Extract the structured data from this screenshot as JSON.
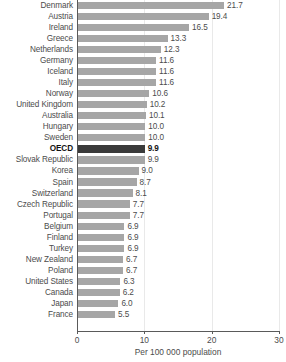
{
  "chart_data": {
    "type": "bar",
    "orientation": "horizontal",
    "title": "",
    "xlabel": "Per 100 000 population",
    "ylabel": "",
    "xlim": [
      0,
      30
    ],
    "xticks": [
      0,
      10,
      20,
      30
    ],
    "grid": true,
    "legend": false,
    "highlight_category": "OECD",
    "categories": [
      "Denmark",
      "Austria",
      "Ireland",
      "Greece",
      "Netherlands",
      "Germany",
      "Iceland",
      "Italy",
      "Norway",
      "United Kingdom",
      "Australia",
      "Hungary",
      "Sweden",
      "OECD",
      "Slovak Republic",
      "Korea",
      "Spain",
      "Switzerland",
      "Czech Republic",
      "Portugal",
      "Belgium",
      "Finland",
      "Turkey",
      "New Zealand",
      "Poland",
      "United States",
      "Canada",
      "Japan",
      "France"
    ],
    "values": [
      21.7,
      19.4,
      16.5,
      13.3,
      12.3,
      11.6,
      11.6,
      11.6,
      10.6,
      10.2,
      10.1,
      10.0,
      10.0,
      9.9,
      9.9,
      9.0,
      8.7,
      8.1,
      7.7,
      7.7,
      6.9,
      6.9,
      6.9,
      6.7,
      6.7,
      6.3,
      6.2,
      6.0,
      5.5
    ],
    "value_labels": [
      "21.7",
      "19.4",
      "16.5",
      "13.3",
      "12.3",
      "11.6",
      "11.6",
      "11.6",
      "10.6",
      "10.2",
      "10.1",
      "10.0",
      "10.0",
      "9.9",
      "9.9",
      "9.0",
      "8.7",
      "8.1",
      "7.7",
      "7.7",
      "6.9",
      "6.9",
      "6.9",
      "6.7",
      "6.7",
      "6.3",
      "6.2",
      "6.0",
      "5.5"
    ],
    "xtick_labels": [
      "0",
      "10",
      "20",
      "30"
    ],
    "colors": {
      "bar": "#a6a6a6",
      "bar_highlight": "#3a3a3a",
      "axis": "#5a5a5a",
      "grid": "#e9e9e9",
      "text": "#4c4c4c",
      "text_highlight": "#141414",
      "background": "#ffffff"
    }
  }
}
